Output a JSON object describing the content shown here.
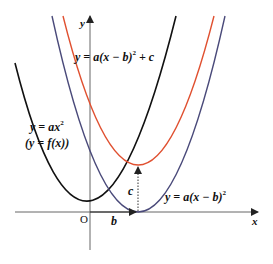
{
  "diagram": {
    "colors": {
      "axis": "#555555",
      "base_curve": "#111111",
      "shifted_curve": "#4a4a7a",
      "shifted_up_curve": "#e05030",
      "dotted_arrow": "#333333"
    },
    "axes": {
      "x_label": "x",
      "y_label": "y",
      "origin_label": "O"
    },
    "curves": [
      {
        "id": "base",
        "label_line1_pre": "y = ax",
        "label_line1_sup": "2",
        "label_line2": "(y = f(x))"
      },
      {
        "id": "shifted",
        "label_pre": "y = a(x − b)",
        "label_sup": "2"
      },
      {
        "id": "shifted_up",
        "label_pre": "y = a(x − b)",
        "label_sup": "2",
        "label_post": " + c"
      }
    ],
    "shift_labels": {
      "horizontal": "b",
      "vertical": "c"
    }
  }
}
